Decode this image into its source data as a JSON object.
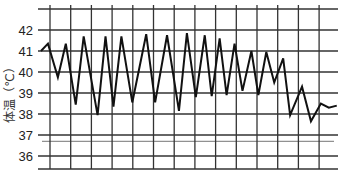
{
  "chart_data": {
    "type": "line",
    "title": "",
    "xlabel": "",
    "ylabel": "体温（℃）",
    "ylim": [
      35.3,
      43.0
    ],
    "yticks": [
      36,
      37,
      38,
      39,
      40,
      41,
      42
    ],
    "ytick_labels": [
      "36",
      "37",
      "38",
      "39",
      "40",
      "41",
      "42"
    ],
    "extra_hline": 36.7,
    "grid": true,
    "x_divisions": 15,
    "legend": "none",
    "series": [
      {
        "name": "体温",
        "x": [
          0,
          0.35,
          0.85,
          1.25,
          1.75,
          2.15,
          2.85,
          3.25,
          3.65,
          4.05,
          4.6,
          5.3,
          5.75,
          6.35,
          6.95,
          7.35,
          7.8,
          8.25,
          8.6,
          9.0,
          9.35,
          9.75,
          10.15,
          10.6,
          10.95,
          11.35,
          11.75,
          12.2,
          12.55,
          13.15,
          13.6,
          14.1,
          14.5,
          14.9
        ],
        "values": [
          41.0,
          41.35,
          39.75,
          41.35,
          38.45,
          41.7,
          37.95,
          41.7,
          38.35,
          41.7,
          38.55,
          41.8,
          38.55,
          41.75,
          38.15,
          41.85,
          38.8,
          41.75,
          38.85,
          41.6,
          38.9,
          41.35,
          39.1,
          41.0,
          38.9,
          40.95,
          39.5,
          40.65,
          37.95,
          39.3,
          37.65,
          38.5,
          38.3,
          38.4
        ]
      }
    ]
  }
}
